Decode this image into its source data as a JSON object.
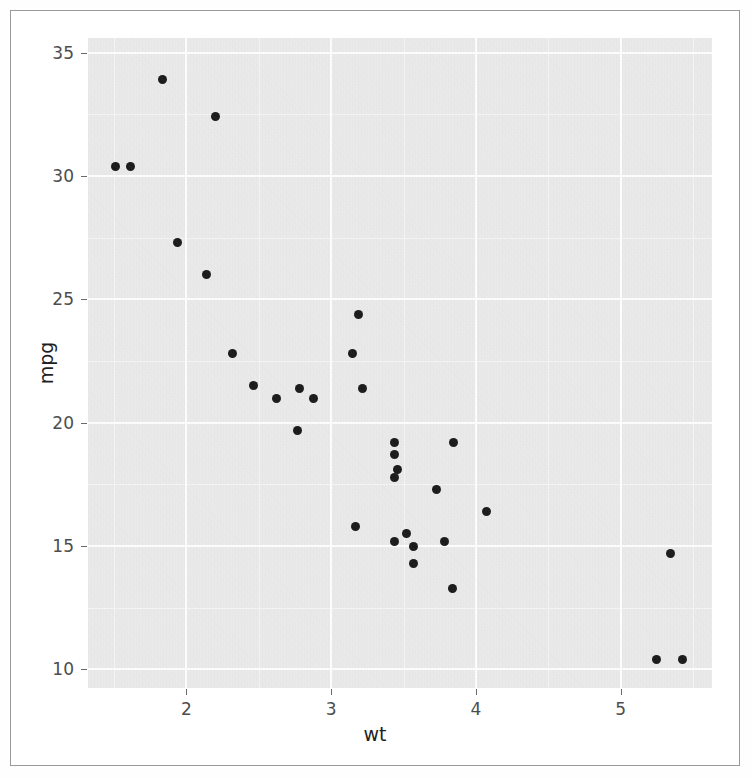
{
  "figure": {
    "background_color": "#ffffff",
    "panel_color": "#ebebeb",
    "grid_color": "#ffffff",
    "point_color": "#1a1a1a",
    "axis_text_color": "#4d4d4d",
    "axis_title_color": "#1f1f1f",
    "frame_border_color": "#9a9a9a"
  },
  "chart_data": {
    "type": "scatter",
    "title": "",
    "subtitle": "",
    "xlabel": "wt",
    "ylabel": "mpg",
    "xlim": [
      1.32,
      5.63
    ],
    "ylim": [
      9.25,
      35.6
    ],
    "xticks": [
      2,
      3,
      4,
      5
    ],
    "xticklabels": [
      "2",
      "3",
      "4",
      "5"
    ],
    "yticks": [
      10,
      15,
      20,
      25,
      30,
      35
    ],
    "yticklabels": [
      "10",
      "15",
      "20",
      "25",
      "30",
      "35"
    ],
    "x_minor_ticks": [
      1.5,
      2.5,
      3.5,
      4.5,
      5.5
    ],
    "y_minor_ticks": [
      12.5,
      17.5,
      22.5,
      27.5,
      32.5
    ],
    "grid": true,
    "grid_style": "major white, minor light",
    "legend": false,
    "legend_position": "none",
    "marker": "filled-circle",
    "marker_size": 9,
    "series": [
      {
        "name": "mtcars",
        "x": [
          2.62,
          2.875,
          2.32,
          3.215,
          3.44,
          3.46,
          3.57,
          3.19,
          3.15,
          3.44,
          3.44,
          4.07,
          3.73,
          3.78,
          5.25,
          5.424,
          5.345,
          2.2,
          1.615,
          1.835,
          2.465,
          3.52,
          3.435,
          3.84,
          3.845,
          1.935,
          2.14,
          1.513,
          3.17,
          2.77,
          3.57,
          2.78
        ],
        "y": [
          21.0,
          21.0,
          22.8,
          21.4,
          18.7,
          18.1,
          14.3,
          24.4,
          22.8,
          19.2,
          17.8,
          16.4,
          17.3,
          15.2,
          10.4,
          10.4,
          14.7,
          32.4,
          30.4,
          33.9,
          21.5,
          15.5,
          15.2,
          13.3,
          19.2,
          27.3,
          26.0,
          30.4,
          15.8,
          19.7,
          15.0,
          21.4
        ]
      }
    ]
  },
  "axes": {
    "y_title": "mpg",
    "x_title": "wt"
  }
}
